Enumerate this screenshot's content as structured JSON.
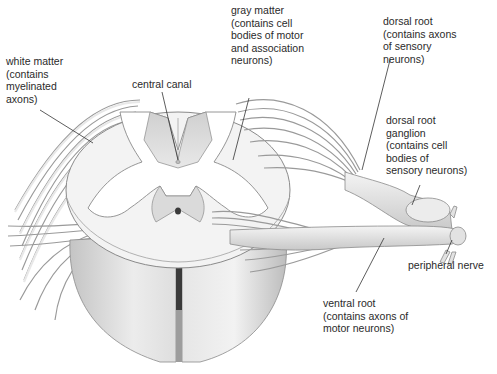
{
  "figure": {
    "labels": {
      "white_matter": "white matter\n(contains\nmyelinated\naxons)",
      "central_canal": "central canal",
      "gray_matter": "gray matter\n(contains cell\nbodies of motor\nand association\nneurons)",
      "dorsal_root": "dorsal root\n(contains axons\nof sensory\nneurons)",
      "dorsal_root_ganglion": "dorsal root\nganglion\n(contains cell\nbodies of\nsensory neurons)",
      "peripheral_nerve": "peripheral nerve",
      "ventral_root": "ventral root\n(contains axons of\nmotor neurons)"
    },
    "colors": {
      "background": "#ffffff",
      "tissue_light": "#f2f2f2",
      "tissue_mid": "#d6d6d6",
      "tissue_dark": "#a8a8a8",
      "outline": "#8a8a8a",
      "leader_line": "#333333",
      "text": "#2a2a2a"
    }
  }
}
